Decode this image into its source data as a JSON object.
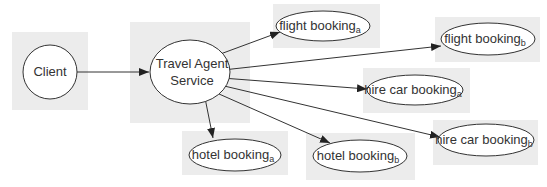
{
  "diagram": {
    "colors": {
      "shadow": "#ececec",
      "stroke": "#333333",
      "text": "#333333"
    },
    "nodes": {
      "client": {
        "label": "Client"
      },
      "travel_agent": {
        "line1": "Travel Agent",
        "line2": "Service"
      },
      "flight_a": {
        "label": "flight booking",
        "sub": "a"
      },
      "flight_b": {
        "label": "flight booking",
        "sub": "b"
      },
      "hire_car_a": {
        "label": "hire car booking",
        "sub": "a"
      },
      "hire_car_b": {
        "label": "hire car booking",
        "sub": "b"
      },
      "hotel_a": {
        "label": "hotel booking",
        "sub": "a"
      },
      "hotel_b": {
        "label": "hotel booking",
        "sub": "b"
      }
    },
    "edges": [
      {
        "from": "client",
        "to": "travel_agent"
      },
      {
        "from": "travel_agent",
        "to": "flight_a"
      },
      {
        "from": "travel_agent",
        "to": "flight_b"
      },
      {
        "from": "travel_agent",
        "to": "hire_car_a"
      },
      {
        "from": "travel_agent",
        "to": "hire_car_b"
      },
      {
        "from": "travel_agent",
        "to": "hotel_a"
      },
      {
        "from": "travel_agent",
        "to": "hotel_b"
      }
    ]
  }
}
